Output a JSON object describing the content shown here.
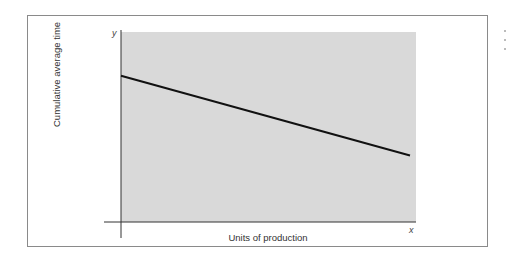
{
  "chart_data": {
    "type": "line",
    "title": "",
    "xlabel": "Units of production",
    "ylabel": "Cumulative average time",
    "x_axis_symbol": "x",
    "y_axis_symbol": "y",
    "grid": false,
    "legend": null,
    "x_ticks": [],
    "y_ticks": [],
    "series": [
      {
        "name": "Cumulative average time",
        "description": "Straight line, decreasing from upper left to lower right (learning curve on log-log scale)",
        "x": [
          0,
          1
        ],
        "y": [
          0.77,
          0.35
        ]
      }
    ],
    "xlim": [
      0,
      1
    ],
    "ylim": [
      0,
      1
    ],
    "plot_background": "#d9d9d9",
    "line_color": "#111111"
  },
  "labels": {
    "x_axis": "Units of production",
    "y_axis": "Cumulative average time",
    "x_symbol": "x",
    "y_symbol": "y"
  }
}
